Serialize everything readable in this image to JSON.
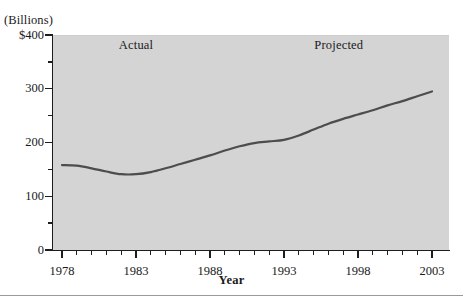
{
  "figure": {
    "unit_label": "(Billions)",
    "x_axis_title": "Year",
    "annotations": [
      {
        "text": "Actual",
        "x_year": 1983.0,
        "y_value": 380
      },
      {
        "text": "Projected",
        "x_year": 1996.7,
        "y_value": 380
      }
    ]
  },
  "chart_data": {
    "type": "line",
    "title": "",
    "subtitle": "",
    "xlabel": "Year",
    "ylabel": "(Billions)",
    "xlim": [
      1978,
      2003
    ],
    "ylim": [
      0,
      400
    ],
    "grid": false,
    "legend": "none",
    "y_ticks_major": [
      0,
      100,
      200,
      300,
      400
    ],
    "y_tick_labels": [
      "0",
      "100",
      "200",
      "300",
      "$400"
    ],
    "y_ticks_minor": [
      50,
      150,
      250,
      350
    ],
    "x_ticks_major": [
      1978,
      1983,
      1988,
      1993,
      1998,
      2003
    ],
    "x_tick_labels": [
      "1978",
      "1983",
      "1988",
      "1993",
      "1998",
      "2003"
    ],
    "x_ticks_minor": [
      1979,
      1980,
      1981,
      1982,
      1984,
      1985,
      1986,
      1987,
      1989,
      1990,
      1991,
      1992,
      1994,
      1995,
      1996,
      1997,
      1999,
      2000,
      2001,
      2002
    ],
    "line_color": "#4d4d4d",
    "plot_background": "#d4d4d4",
    "annotations": [
      "Actual",
      "Projected"
    ],
    "x": [
      1978,
      1979,
      1980,
      1981,
      1982,
      1983,
      1984,
      1985,
      1986,
      1987,
      1988,
      1989,
      1990,
      1991,
      1992,
      1993,
      1994,
      1995,
      1996,
      1997,
      1998,
      1999,
      2000,
      2001,
      2002,
      2003
    ],
    "values": [
      158,
      157,
      152,
      146,
      141,
      141,
      145,
      152,
      160,
      168,
      176,
      185,
      193,
      199,
      202,
      205,
      213,
      224,
      235,
      244,
      252,
      260,
      269,
      277,
      286,
      295
    ],
    "series": [
      {
        "name": "Spending",
        "values": [
          158,
          157,
          152,
          146,
          141,
          141,
          145,
          152,
          160,
          168,
          176,
          185,
          193,
          199,
          202,
          205,
          213,
          224,
          235,
          244,
          252,
          260,
          269,
          277,
          286,
          295
        ]
      }
    ]
  }
}
